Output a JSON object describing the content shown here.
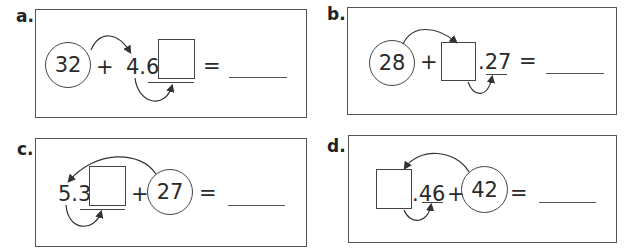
{
  "problems": [
    {
      "id": "a",
      "label": "a.",
      "whole": "32",
      "plus": "+",
      "number_text": "4.6",
      "underlined": "",
      "equals": "=",
      "answer": ""
    },
    {
      "id": "b",
      "label": "b.",
      "whole": "28",
      "plus": "+",
      "number_text": ".27",
      "underlined": "27",
      "equals": "=",
      "answer": ""
    },
    {
      "id": "c",
      "label": "c.",
      "whole": "27",
      "plus": "+",
      "number_text": "5.3",
      "underlined": "",
      "equals": "=",
      "answer": ""
    },
    {
      "id": "d",
      "label": "d.",
      "whole": "42",
      "plus": "+",
      "number_text": ".46",
      "underlined": "46",
      "equals": "=",
      "answer": ""
    }
  ],
  "colors": {
    "line": "#444444",
    "text": "#2a2a2a",
    "background": "#ffffff"
  }
}
